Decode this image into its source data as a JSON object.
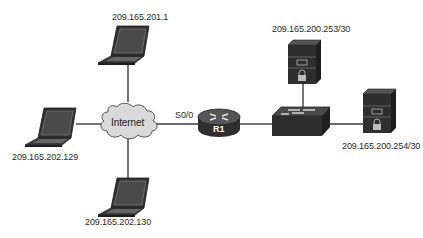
{
  "diagram": {
    "type": "network-topology",
    "nodes": {
      "internet": {
        "label": "Internet",
        "kind": "cloud"
      },
      "router": {
        "label": "R1",
        "kind": "router",
        "interface_label": "S0/0"
      },
      "switch": {
        "label": "",
        "kind": "switch"
      },
      "laptop_top": {
        "label": "209.165.201.1",
        "kind": "laptop"
      },
      "laptop_left": {
        "label": "209.165.202.129",
        "kind": "laptop"
      },
      "laptop_bottom": {
        "label": "209.165.202.130",
        "kind": "laptop"
      },
      "server_top": {
        "label": "209.165.200.253/30",
        "kind": "server"
      },
      "server_right": {
        "label": "209.165.200.254/30",
        "kind": "server"
      }
    },
    "links": [
      {
        "from": "laptop_top",
        "to": "internet"
      },
      {
        "from": "laptop_left",
        "to": "internet"
      },
      {
        "from": "laptop_bottom",
        "to": "internet"
      },
      {
        "from": "internet",
        "to": "router",
        "label": "S0/0"
      },
      {
        "from": "router",
        "to": "switch"
      },
      {
        "from": "switch",
        "to": "server_top"
      },
      {
        "from": "switch",
        "to": "server_right"
      }
    ],
    "colors": {
      "line": "#3a3a3a",
      "device_dark": "#3c3c3c",
      "cloud_fill": "#d8d8d8",
      "text": "#2a2a2a"
    }
  }
}
